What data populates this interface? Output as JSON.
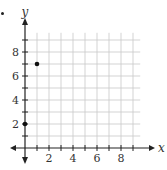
{
  "chart_data": {
    "type": "scatter",
    "title": "",
    "xlabel": "x",
    "ylabel": "y",
    "xlim": [
      -1,
      9.5
    ],
    "ylim": [
      -1,
      9.5
    ],
    "grid": true,
    "x_ticks": [
      2,
      4,
      6,
      8
    ],
    "y_ticks": [
      2,
      4,
      6,
      8
    ],
    "points": [
      {
        "x": 0,
        "y": 2
      },
      {
        "x": 1,
        "y": 7
      }
    ]
  },
  "colors": {
    "grid": "#c8c8c8",
    "axis": "#222222",
    "point": "#111111"
  }
}
